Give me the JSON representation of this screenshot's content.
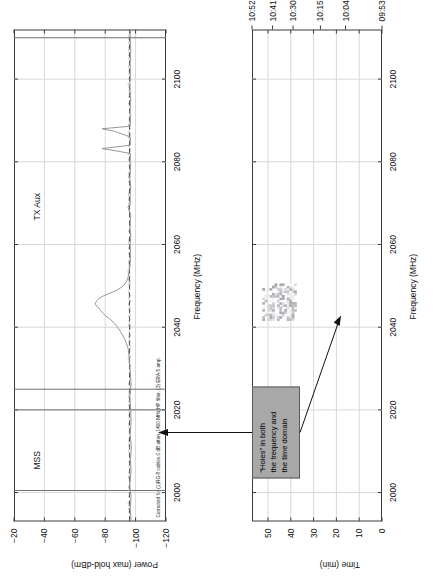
{
  "figure": {
    "width": 581,
    "height": 434,
    "background": "#ffffff",
    "axis_color": "#3a3a3a",
    "grid_color": "#d8d8d8",
    "trace_color": "#8c8c8c",
    "noise_floor_color": "#4a4a4a",
    "callout_fill": "#a8a8a8",
    "callout_border": "#5a5a5a"
  },
  "annotation": {
    "callout_lines": [
      "“Holes” in both",
      "the frequency and",
      "the time domain"
    ]
  },
  "chart_data": [
    {
      "type": "line",
      "id": "max-hold-spectrum",
      "title": "",
      "xlabel": "Frequency (MHz)",
      "ylabel": "Power (max hold-dBm)",
      "xlim": [
        1993,
        2112
      ],
      "ylim": [
        -120,
        -20
      ],
      "xticks": [
        2000,
        2020,
        2040,
        2060,
        2080,
        2100
      ],
      "xtick_labels": [
        "2000",
        "2020",
        "2040",
        "2060",
        "2080",
        "2100"
      ],
      "yticks": [
        -20,
        -40,
        -60,
        -80,
        -100,
        -120
      ],
      "ytick_labels": [
        "−20",
        "−40",
        "−60",
        "−80",
        "−100",
        "−120"
      ],
      "grid": true,
      "legend": "",
      "band_labels": [
        {
          "text": "MSS",
          "freq_mhz": 2008,
          "power_dbm": -28
        },
        {
          "text": "TX Aux",
          "freq_mhz": 2068,
          "power_dbm": -28
        }
      ],
      "band_markers": [
        {
          "name": "mss-band-left",
          "freq_mhz": 2000.5
        },
        {
          "name": "mss-band-right",
          "freq_mhz": 2020.0
        },
        {
          "name": "txaux-band-left",
          "freq_mhz": 2025.0
        },
        {
          "name": "txaux-band-right",
          "freq_mhz": 2110.0
        }
      ],
      "noise_floor_dbm": -96,
      "footnote": "Corrected for (1)RG-8 cables.0 dB atten. 1400 MHz HP filter. (3) ERA-5 amp.",
      "series": [
        {
          "name": "max hold trace",
          "x": [
            1993,
            1996,
            1999,
            2002,
            2005,
            2008,
            2011,
            2014,
            2017,
            2020,
            2023,
            2026,
            2029,
            2032,
            2035,
            2037,
            2039,
            2040,
            2041,
            2042,
            2042.8,
            2043.4,
            2044,
            2044.6,
            2045.2,
            2045.8,
            2046.4,
            2047,
            2047.6,
            2048.2,
            2049,
            2050,
            2051,
            2052,
            2053,
            2054,
            2055,
            2056,
            2058,
            2060,
            2062,
            2064,
            2066,
            2068,
            2069,
            2070,
            2072,
            2074,
            2076,
            2078,
            2080,
            2082,
            2082.6,
            2083.2,
            2084,
            2086,
            2087.4,
            2088,
            2088.6,
            2090,
            2092,
            2095,
            2098,
            2101,
            2104,
            2107,
            2110,
            2112
          ],
          "y": [
            -97,
            -96.5,
            -97,
            -96,
            -97,
            -96.6,
            -97.2,
            -96.4,
            -97,
            -96.8,
            -96.2,
            -97,
            -96.5,
            -96,
            -95,
            -93,
            -90,
            -88,
            -86,
            -83,
            -80,
            -78.5,
            -77,
            -76,
            -74,
            -73.5,
            -74.5,
            -76,
            -79,
            -83,
            -88,
            -92,
            -94,
            -95,
            -95.5,
            -96,
            -96.2,
            -96.5,
            -96.6,
            -96.4,
            -96.8,
            -96.3,
            -96.6,
            -96.2,
            -95,
            -96.5,
            -96.4,
            -96.8,
            -96.2,
            -96.6,
            -96.4,
            -96.6,
            -88,
            -78,
            -96.5,
            -96.6,
            -86,
            -78,
            -96.4,
            -96.6,
            -96.3,
            -96.7,
            -96.2,
            -96.6,
            -96.4,
            -96.8,
            -96.4,
            -96.6
          ]
        }
      ]
    },
    {
      "type": "heatmap",
      "id": "spectrogram-waterfall",
      "title": "",
      "xlabel": "Frequency (MHz)",
      "ylabel": "Time (min)",
      "xlim": [
        1993,
        2112
      ],
      "ylim": [
        0,
        57
      ],
      "xticks": [
        2000,
        2020,
        2040,
        2060,
        2080,
        2100
      ],
      "xtick_labels": [
        "2000",
        "2020",
        "2040",
        "2060",
        "2080",
        "2100"
      ],
      "yticks": [
        0,
        10,
        20,
        30,
        40,
        50
      ],
      "ytick_labels": [
        "0",
        "10",
        "20",
        "30",
        "40",
        "50"
      ],
      "grid": true,
      "right_axis_label": "Clock time",
      "right_ticks": [
        {
          "value": 57,
          "label": "10:52"
        },
        {
          "value": 48,
          "label": "10:41"
        },
        {
          "value": 39,
          "label": "10:30"
        },
        {
          "value": 27,
          "label": "10:15"
        },
        {
          "value": 16,
          "label": "10:04"
        },
        {
          "value": 0,
          "label": "09:53"
        }
      ],
      "signal_blob": {
        "name": "intermittent-emission",
        "freq_center_mhz": 2046,
        "freq_width_mhz": 9,
        "time_center_min": 45,
        "time_height_min": 15,
        "description": "faint intermittent emission with holes in frequency and time"
      }
    }
  ]
}
